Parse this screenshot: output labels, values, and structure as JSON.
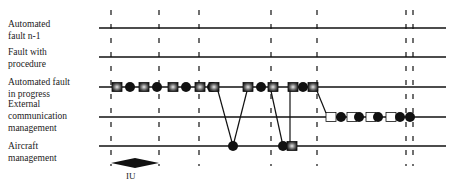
{
  "lanes": [
    {
      "id": "auto-n1",
      "label_lines": [
        "Automated",
        "fault n-1"
      ]
    },
    {
      "id": "fault-proc",
      "label_lines": [
        "Fault with",
        "procedure"
      ]
    },
    {
      "id": "auto-progress",
      "label_lines": [
        "Automated fault",
        "in progress"
      ]
    },
    {
      "id": "ext-comm",
      "label_lines": [
        "External",
        "communication",
        "management"
      ]
    },
    {
      "id": "aircraft",
      "label_lines": [
        "Aircraft",
        "management"
      ]
    }
  ],
  "time_markers": 7,
  "interval_label": "IU",
  "colors": {
    "line": "#111111",
    "fill": "#111111",
    "light": "#ffffff"
  }
}
